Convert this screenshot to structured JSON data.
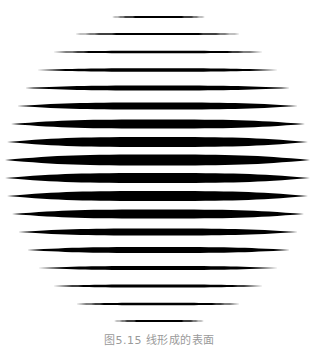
{
  "figure": {
    "line_color": "#000000",
    "background": "#ffffff",
    "lines": [
      {
        "y": 17,
        "x1": 112,
        "x2": 205,
        "thickness": 2
      },
      {
        "y": 34,
        "x1": 75,
        "x2": 240,
        "thickness": 2
      },
      {
        "y": 52,
        "x1": 53,
        "x2": 263,
        "thickness": 2.5
      },
      {
        "y": 70,
        "x1": 37,
        "x2": 278,
        "thickness": 3.5
      },
      {
        "y": 88,
        "x1": 25,
        "x2": 290,
        "thickness": 5
      },
      {
        "y": 106,
        "x1": 17,
        "x2": 298,
        "thickness": 7
      },
      {
        "y": 124,
        "x1": 11,
        "x2": 305,
        "thickness": 9
      },
      {
        "y": 142,
        "x1": 7,
        "x2": 308,
        "thickness": 10
      },
      {
        "y": 160,
        "x1": 5,
        "x2": 310,
        "thickness": 11
      },
      {
        "y": 178,
        "x1": 5,
        "x2": 310,
        "thickness": 10
      },
      {
        "y": 196,
        "x1": 7,
        "x2": 308,
        "thickness": 10
      },
      {
        "y": 214,
        "x1": 12,
        "x2": 304,
        "thickness": 9
      },
      {
        "y": 232,
        "x1": 18,
        "x2": 298,
        "thickness": 7
      },
      {
        "y": 250,
        "x1": 27,
        "x2": 290,
        "thickness": 6
      },
      {
        "y": 268,
        "x1": 38,
        "x2": 278,
        "thickness": 4
      },
      {
        "y": 286,
        "x1": 53,
        "x2": 263,
        "thickness": 3
      },
      {
        "y": 304,
        "x1": 76,
        "x2": 240,
        "thickness": 2.5
      },
      {
        "y": 321,
        "x1": 114,
        "x2": 204,
        "thickness": 2
      }
    ]
  },
  "caption": {
    "text": "图5.15  线形成的表面"
  }
}
